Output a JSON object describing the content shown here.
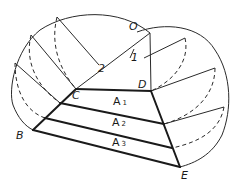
{
  "diagram": {
    "points": {
      "O": {
        "label": "O",
        "x": 150,
        "y": 33
      },
      "C": {
        "label": "C",
        "x": 76,
        "y": 89
      },
      "D": {
        "label": "D",
        "x": 151,
        "y": 91
      },
      "B": {
        "label": "B",
        "x": 33,
        "y": 130
      },
      "E": {
        "label": "E",
        "x": 180,
        "y": 167
      }
    },
    "line_labels": {
      "one": "1",
      "two": "2"
    },
    "areas": [
      {
        "letter": "A",
        "index": "1"
      },
      {
        "letter": "A",
        "index": "2"
      },
      {
        "letter": "A",
        "index": "3"
      }
    ],
    "colors": {
      "ink": "#1a1a1a",
      "background": "#ffffff"
    }
  }
}
